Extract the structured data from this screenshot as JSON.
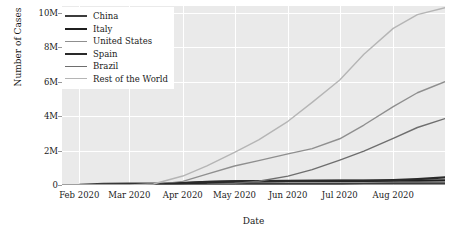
{
  "chart_data": {
    "type": "line",
    "title": "",
    "xlabel": "Date",
    "ylabel": "Number of Cases",
    "grid": true,
    "legend_position": "upper-left",
    "xlim": [
      "2020-01-22",
      "2020-08-31"
    ],
    "ylim": [
      0,
      10400000
    ],
    "yticks": [
      {
        "value": 0,
        "label": "0"
      },
      {
        "value": 2000000,
        "label": "2M"
      },
      {
        "value": 4000000,
        "label": "4M"
      },
      {
        "value": 6000000,
        "label": "6M"
      },
      {
        "value": 8000000,
        "label": "8M"
      },
      {
        "value": 10000000,
        "label": "10M"
      }
    ],
    "xticks": [
      {
        "value": "2020-02-01",
        "label": "Feb 2020"
      },
      {
        "value": "2020-03-01",
        "label": "Mar 2020"
      },
      {
        "value": "2020-04-01",
        "label": "Apr 2020"
      },
      {
        "value": "2020-05-01",
        "label": "May 2020"
      },
      {
        "value": "2020-06-01",
        "label": "Jun 2020"
      },
      {
        "value": "2020-07-01",
        "label": "Jul 2020"
      },
      {
        "value": "2020-08-01",
        "label": "Aug 2020"
      }
    ],
    "x": [
      "2020-01-22",
      "2020-02-01",
      "2020-02-15",
      "2020-03-01",
      "2020-03-15",
      "2020-04-01",
      "2020-04-15",
      "2020-05-01",
      "2020-05-15",
      "2020-06-01",
      "2020-06-15",
      "2020-07-01",
      "2020-07-15",
      "2020-08-01",
      "2020-08-15",
      "2020-08-31"
    ],
    "series": [
      {
        "name": "China",
        "color": "#3c3c3c",
        "values": [
          580,
          14380,
          68500,
          80150,
          81050,
          82630,
          83350,
          83950,
          84050,
          84600,
          85000,
          85400,
          85800,
          88800,
          89700,
          90100
        ]
      },
      {
        "name": "Italy",
        "color": "#1f1f1f",
        "values": [
          0,
          0,
          3,
          1700,
          24750,
          110570,
          165150,
          207430,
          223880,
          233190,
          237290,
          240760,
          243230,
          248070,
          252800,
          269200
        ]
      },
      {
        "name": "United States",
        "color": "#8f8f8f",
        "values": [
          1,
          8,
          15,
          75,
          3500,
          213400,
          636350,
          1103460,
          1417780,
          1811270,
          2117000,
          2686000,
          3485000,
          4551000,
          5360000,
          6000000
        ]
      },
      {
        "name": "Spain",
        "color": "#2a2a2a",
        "values": [
          0,
          0,
          2,
          84,
          7800,
          104120,
          177640,
          213440,
          230700,
          239640,
          244680,
          250550,
          258850,
          288520,
          342800,
          439300
        ]
      },
      {
        "name": "Brazil",
        "color": "#6e6e6e",
        "values": [
          0,
          0,
          0,
          2,
          200,
          6840,
          28300,
          92100,
          220290,
          514850,
          891550,
          1448750,
          1966750,
          2707000,
          3340000,
          3860000
        ]
      },
      {
        "name": "Rest of the World",
        "color": "#b5b5b5",
        "values": [
          20,
          110,
          800,
          6200,
          60000,
          520000,
          1110000,
          1900000,
          2620000,
          3700000,
          4800000,
          6100000,
          7600000,
          9100000,
          9900000,
          10300000
        ]
      }
    ]
  },
  "legend": {
    "items": [
      {
        "label": "China"
      },
      {
        "label": "Italy"
      },
      {
        "label": "United States"
      },
      {
        "label": "Spain"
      },
      {
        "label": "Brazil"
      },
      {
        "label": "Rest of the World"
      }
    ]
  }
}
